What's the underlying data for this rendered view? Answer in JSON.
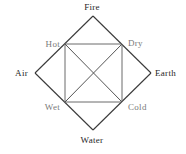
{
  "diagram": {
    "elements": {
      "top": "Fire",
      "left": "Air",
      "right": "Earth",
      "bottom": "Water"
    },
    "qualities": {
      "top_left": "Hot",
      "top_right": "Dry",
      "bottom_left": "Wet",
      "bottom_right": "Cold"
    },
    "relations": [
      {
        "from": "Hot",
        "to": "Dry",
        "via": "Fire"
      },
      {
        "from": "Hot",
        "to": "Wet",
        "via": "Air"
      },
      {
        "from": "Dry",
        "to": "Cold",
        "via": "Earth"
      },
      {
        "from": "Wet",
        "to": "Cold",
        "via": "Water"
      },
      {
        "from": "Hot",
        "to": "Cold",
        "type": "opposite"
      },
      {
        "from": "Dry",
        "to": "Wet",
        "type": "opposite"
      }
    ],
    "colors": {
      "element_text": "#262626",
      "quality_text": "#7a7a7a",
      "diamond_line": "#3a3a3a",
      "square_line": "#6a6a6a"
    }
  }
}
